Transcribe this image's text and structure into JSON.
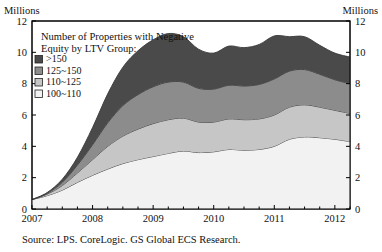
{
  "axes": {
    "left_unit_label": "Millions",
    "right_unit_label": "Millions",
    "y_ticks": [
      "0",
      "2",
      "4",
      "6",
      "8",
      "10",
      "12"
    ],
    "x_ticks": [
      "2007",
      "2008",
      "2009",
      "2010",
      "2011",
      "2012"
    ]
  },
  "legend": {
    "title_line1": "Number of Properties with Negative",
    "title_line2": "Equity by LTV Group:",
    "items": [
      {
        "label": ">150",
        "color": "#4a4a4a"
      },
      {
        "label": "125~150",
        "color": "#8c8c8c"
      },
      {
        "label": "110~125",
        "color": "#c6c6c6"
      },
      {
        "label": "100~110",
        "color": "#f2f2f2"
      }
    ]
  },
  "source": {
    "text": "Source: LPS. CoreLogic. GS Global ECS Research."
  },
  "chart_data": {
    "type": "area",
    "title": "Number of Properties with Negative Equity by LTV Group",
    "xlabel": "",
    "ylabel": "Millions",
    "ylim": [
      0,
      12
    ],
    "xlim": [
      2007.0,
      2012.25
    ],
    "grid": false,
    "stacked": true,
    "legend_position": "top-left-inset",
    "units": "Millions of properties",
    "x": [
      2007.0,
      2007.25,
      2007.5,
      2007.75,
      2008.0,
      2008.25,
      2008.5,
      2008.75,
      2009.0,
      2009.25,
      2009.5,
      2009.75,
      2010.0,
      2010.25,
      2010.5,
      2010.75,
      2011.0,
      2011.25,
      2011.5,
      2011.75,
      2012.0,
      2012.25
    ],
    "series": [
      {
        "name": "100~110",
        "color": "#f2f2f2",
        "values": [
          0.6,
          0.85,
          1.2,
          1.7,
          2.15,
          2.55,
          2.9,
          3.15,
          3.35,
          3.55,
          3.7,
          3.6,
          3.65,
          3.8,
          3.75,
          3.8,
          4.0,
          4.45,
          4.6,
          4.55,
          4.45,
          4.3
        ]
      },
      {
        "name": "110~125",
        "color": "#c6c6c6",
        "values": [
          0.0,
          0.1,
          0.3,
          0.6,
          1.0,
          1.45,
          1.75,
          1.95,
          2.1,
          2.15,
          2.1,
          1.95,
          1.9,
          1.95,
          1.95,
          1.95,
          2.0,
          2.05,
          2.05,
          1.95,
          1.85,
          1.8
        ]
      },
      {
        "name": "125~150",
        "color": "#8c8c8c",
        "values": [
          0.0,
          0.05,
          0.2,
          0.5,
          0.95,
          1.5,
          1.95,
          2.2,
          2.35,
          2.4,
          2.3,
          2.15,
          2.1,
          2.15,
          2.15,
          2.2,
          2.3,
          2.3,
          2.25,
          2.1,
          1.95,
          1.9
        ]
      },
      {
        "name": ">150",
        "color": "#4a4a4a",
        "values": [
          0.0,
          0.05,
          0.2,
          0.5,
          1.1,
          1.85,
          2.45,
          2.8,
          3.0,
          3.1,
          2.9,
          2.5,
          2.3,
          2.5,
          2.45,
          2.55,
          2.75,
          2.2,
          2.1,
          1.85,
          1.7,
          1.7
        ]
      }
    ],
    "totals": [
      0.6,
      1.05,
      1.9,
      3.3,
      5.2,
      7.35,
      9.05,
      10.1,
      10.8,
      11.2,
      11.0,
      10.2,
      9.95,
      10.4,
      10.3,
      10.5,
      11.05,
      11.0,
      11.0,
      10.45,
      9.95,
      9.7
    ],
    "peak": {
      "x": 2009.25,
      "value": 11.2
    }
  }
}
